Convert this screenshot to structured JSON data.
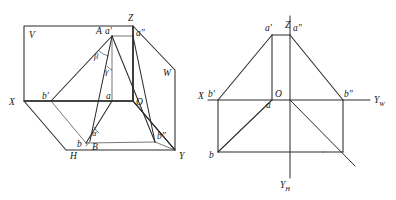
{
  "figure": {
    "type": "technical-line-drawing",
    "background_color": "#ffffff",
    "line_color": "#2b2b2b"
  },
  "left_panel": {
    "name": "pictorial-three-plane-view",
    "planes": [
      {
        "id": "V",
        "label": "V",
        "meaning": "frontal projection plane"
      },
      {
        "id": "W",
        "label": "W",
        "meaning": "profile projection plane"
      },
      {
        "id": "H",
        "label": "H",
        "meaning": "horizontal projection plane"
      }
    ],
    "axes": [
      {
        "id": "X-left",
        "label": "X"
      },
      {
        "id": "Z-top",
        "label": "Z"
      },
      {
        "id": "Y-right",
        "label": "Y"
      },
      {
        "id": "O-origin",
        "label": "O"
      }
    ],
    "points": [
      {
        "id": "A",
        "label": "A"
      },
      {
        "id": "a-prime",
        "label": "a′"
      },
      {
        "id": "a-double-prime",
        "label": "a″"
      },
      {
        "id": "a",
        "label": "a"
      },
      {
        "id": "B",
        "label": "B"
      },
      {
        "id": "b-prime",
        "label": "b′"
      },
      {
        "id": "b-double-prime",
        "label": "b″"
      },
      {
        "id": "b",
        "label": "b"
      }
    ],
    "angles": [
      {
        "id": "alpha",
        "label": "α",
        "meaning": "angle to H plane"
      },
      {
        "id": "beta",
        "label": "β",
        "meaning": "angle to V plane"
      },
      {
        "id": "gamma",
        "label": "γ",
        "meaning": "angle to W plane"
      }
    ]
  },
  "right_panel": {
    "name": "unfolded-projection-view",
    "axes": [
      {
        "id": "Z-up",
        "label": "Z"
      },
      {
        "id": "X-left",
        "label": "X"
      },
      {
        "id": "Yw-right",
        "label": "Y",
        "subscript": "W"
      },
      {
        "id": "Yh-down",
        "label": "Y",
        "subscript": "H"
      },
      {
        "id": "O-origin",
        "label": "O"
      }
    ],
    "points": [
      {
        "id": "a-prime",
        "label": "a′"
      },
      {
        "id": "a-double-prime",
        "label": "a″"
      },
      {
        "id": "a",
        "label": "a"
      },
      {
        "id": "b-prime",
        "label": "b′"
      },
      {
        "id": "b-double-prime",
        "label": "b″"
      },
      {
        "id": "b",
        "label": "b"
      }
    ]
  }
}
